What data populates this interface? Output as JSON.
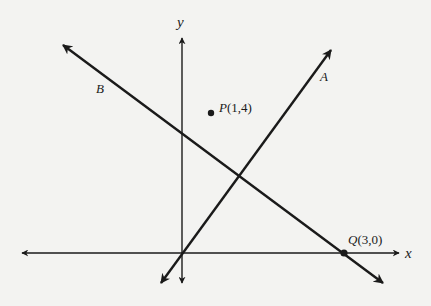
{
  "diagram": {
    "type": "coordinate-plane",
    "axes": {
      "x_label": "x",
      "y_label": "y"
    },
    "lines": [
      {
        "name": "A",
        "label": "A",
        "description": "line through origin with positive slope"
      },
      {
        "name": "B",
        "label": "B",
        "description": "line with negative slope through Q(3,0)"
      }
    ],
    "points": [
      {
        "name": "P",
        "label": "P(1,4)",
        "letter": "P",
        "coords": "(1,4)",
        "x": 1,
        "y": 4
      },
      {
        "name": "Q",
        "label": "Q(3,0)",
        "letter": "Q",
        "coords": "(3,0)",
        "x": 3,
        "y": 0
      }
    ],
    "colors": {
      "background": "#f3f3f1",
      "ink": "#1a1a1a"
    }
  }
}
